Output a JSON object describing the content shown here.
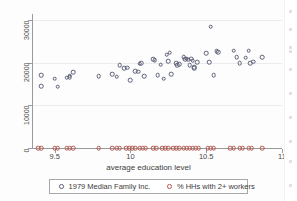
{
  "chart_data": {
    "type": "scatter",
    "title": "",
    "xlabel": "average education level",
    "ylabel": "",
    "xlim": [
      9.35,
      11.0
    ],
    "ylim": [
      0,
      31500
    ],
    "grid": true,
    "legend_position": "bottom",
    "xticks": [
      "9.5",
      "10",
      "10.5",
      "11"
    ],
    "xtick_values": [
      9.5,
      10,
      10.5,
      11
    ],
    "yticks": [
      "0",
      "10000",
      "20000",
      "30000"
    ],
    "ytick_values": [
      0,
      10000,
      20000,
      30000
    ],
    "series": [
      {
        "name": "1979 Median Family Inc.",
        "color": "#5b5f77",
        "marker": "open-circle",
        "points": [
          [
            9.41,
            17100
          ],
          [
            9.41,
            14500
          ],
          [
            9.5,
            16300
          ],
          [
            9.52,
            14400
          ],
          [
            9.58,
            16500
          ],
          [
            9.6,
            16600
          ],
          [
            9.6,
            17000
          ],
          [
            9.62,
            17800
          ],
          [
            9.79,
            16900
          ],
          [
            9.88,
            17300
          ],
          [
            9.91,
            16800
          ],
          [
            9.93,
            19400
          ],
          [
            9.96,
            18700
          ],
          [
            9.98,
            18900
          ],
          [
            10.0,
            15900
          ],
          [
            10.03,
            18100
          ],
          [
            10.05,
            17900
          ],
          [
            10.06,
            19800
          ],
          [
            10.07,
            20000
          ],
          [
            10.09,
            16900
          ],
          [
            10.15,
            20900
          ],
          [
            10.16,
            20600
          ],
          [
            10.18,
            17100
          ],
          [
            10.2,
            19600
          ],
          [
            10.22,
            16300
          ],
          [
            10.24,
            21900
          ],
          [
            10.25,
            20400
          ],
          [
            10.26,
            22400
          ],
          [
            10.27,
            17400
          ],
          [
            10.3,
            20000
          ],
          [
            10.31,
            19400
          ],
          [
            10.32,
            19700
          ],
          [
            10.35,
            21300
          ],
          [
            10.36,
            20900
          ],
          [
            10.37,
            21000
          ],
          [
            10.38,
            20800
          ],
          [
            10.39,
            19400
          ],
          [
            10.4,
            21000
          ],
          [
            10.41,
            20500
          ],
          [
            10.42,
            18800
          ],
          [
            10.42,
            19000
          ],
          [
            10.44,
            20100
          ],
          [
            10.5,
            22300
          ],
          [
            10.52,
            20200
          ],
          [
            10.53,
            28500
          ],
          [
            10.55,
            17100
          ],
          [
            10.57,
            22700
          ],
          [
            10.58,
            22500
          ],
          [
            10.68,
            22900
          ],
          [
            10.7,
            21400
          ],
          [
            10.72,
            19900
          ],
          [
            10.76,
            21200
          ],
          [
            10.78,
            22900
          ],
          [
            10.79,
            20000
          ],
          [
            10.81,
            20300
          ],
          [
            10.87,
            21300
          ]
        ]
      },
      {
        "name": "% HHs with 2+ workers",
        "color": "#b5584e",
        "marker": "open-circle",
        "points": [
          [
            9.39,
            0
          ],
          [
            9.41,
            0
          ],
          [
            9.5,
            0
          ],
          [
            9.52,
            0
          ],
          [
            9.58,
            0
          ],
          [
            9.6,
            0
          ],
          [
            9.62,
            0
          ],
          [
            9.79,
            0
          ],
          [
            9.88,
            0
          ],
          [
            9.91,
            0
          ],
          [
            9.93,
            0
          ],
          [
            9.97,
            0
          ],
          [
            9.99,
            0
          ],
          [
            10.01,
            0
          ],
          [
            10.03,
            0
          ],
          [
            10.06,
            0
          ],
          [
            10.08,
            0
          ],
          [
            10.1,
            0
          ],
          [
            10.15,
            0
          ],
          [
            10.17,
            0
          ],
          [
            10.21,
            0
          ],
          [
            10.23,
            0
          ],
          [
            10.25,
            0
          ],
          [
            10.28,
            0
          ],
          [
            10.3,
            0
          ],
          [
            10.32,
            0
          ],
          [
            10.35,
            0
          ],
          [
            10.37,
            0
          ],
          [
            10.39,
            0
          ],
          [
            10.41,
            0
          ],
          [
            10.43,
            0
          ],
          [
            10.45,
            0
          ],
          [
            10.51,
            0
          ],
          [
            10.53,
            0
          ],
          [
            10.55,
            0
          ],
          [
            10.66,
            0
          ],
          [
            10.68,
            0
          ],
          [
            10.72,
            0
          ],
          [
            10.74,
            0
          ],
          [
            10.78,
            0
          ],
          [
            10.8,
            0
          ],
          [
            10.87,
            0
          ]
        ]
      }
    ]
  },
  "legend": {
    "items": [
      {
        "label": "1979 Median Family Inc."
      },
      {
        "label": "% HHs with 2+ workers"
      }
    ]
  },
  "axes": {
    "x_title": "average education level"
  }
}
